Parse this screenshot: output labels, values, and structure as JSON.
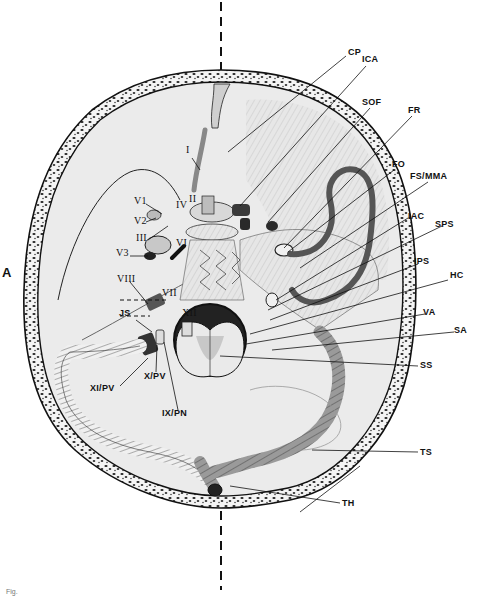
{
  "figure": {
    "panel_label": "A",
    "caption_fragment": "Fig."
  },
  "labels_right": [
    {
      "id": "cp",
      "text": "CP",
      "x": 348,
      "y": 52
    },
    {
      "id": "ica",
      "text": "ICA",
      "x": 362,
      "y": 58
    },
    {
      "id": "sof",
      "text": "SOF",
      "x": 362,
      "y": 100
    },
    {
      "id": "fr",
      "text": "FR",
      "x": 408,
      "y": 108
    },
    {
      "id": "fo",
      "text": "FO",
      "x": 392,
      "y": 162
    },
    {
      "id": "fs_mma",
      "text": "FS/MMA",
      "x": 410,
      "y": 174
    },
    {
      "id": "iac",
      "text": "IAC",
      "x": 408,
      "y": 214
    },
    {
      "id": "sps",
      "text": "SPS",
      "x": 435,
      "y": 222
    },
    {
      "id": "ips",
      "text": "IPS",
      "x": 414,
      "y": 259
    },
    {
      "id": "hc",
      "text": "HC",
      "x": 450,
      "y": 273
    },
    {
      "id": "va",
      "text": "VA",
      "x": 423,
      "y": 310
    },
    {
      "id": "sa",
      "text": "SA",
      "x": 454,
      "y": 328
    },
    {
      "id": "ss",
      "text": "SS",
      "x": 420,
      "y": 363
    },
    {
      "id": "ts",
      "text": "TS",
      "x": 420,
      "y": 450
    },
    {
      "id": "th",
      "text": "TH",
      "x": 342,
      "y": 500
    }
  ],
  "labels_left": [
    {
      "id": "n1",
      "text": "I",
      "x": 186,
      "y": 148
    },
    {
      "id": "v1",
      "text": "V1",
      "x": 134,
      "y": 199
    },
    {
      "id": "n4",
      "text": "IV",
      "x": 177,
      "y": 202
    },
    {
      "id": "n2",
      "text": "II",
      "x": 189,
      "y": 197
    },
    {
      "id": "v2",
      "text": "V2",
      "x": 134,
      "y": 219
    },
    {
      "id": "n3",
      "text": "III",
      "x": 135,
      "y": 235
    },
    {
      "id": "v3",
      "text": "V3",
      "x": 117,
      "y": 250
    },
    {
      "id": "n6",
      "text": "VI",
      "x": 177,
      "y": 240
    },
    {
      "id": "n8",
      "text": "VIII",
      "x": 117,
      "y": 276
    },
    {
      "id": "n7",
      "text": "VII",
      "x": 162,
      "y": 290
    },
    {
      "id": "js",
      "text": "JS",
      "x": 119,
      "y": 310
    },
    {
      "id": "n12",
      "text": "XII",
      "x": 182,
      "y": 310
    },
    {
      "id": "n11_pv",
      "text": "XI/PV",
      "x": 90,
      "y": 386
    },
    {
      "id": "n10_pv",
      "text": "X/PV",
      "x": 144,
      "y": 374
    },
    {
      "id": "n9_pn",
      "text": "IX/PN",
      "x": 162,
      "y": 411
    }
  ],
  "colors": {
    "ink": "#111111",
    "bone_fill": "#e9e9e9",
    "background": "#ffffff",
    "vessel": "#7a7a7a",
    "sinus_dark": "#444444"
  }
}
